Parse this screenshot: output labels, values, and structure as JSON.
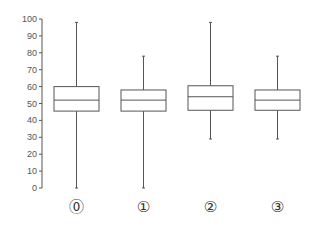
{
  "chart_data": {
    "type": "box",
    "title": "",
    "xlabel": "",
    "ylabel": "",
    "ylim": [
      0,
      100
    ],
    "yticks": [
      0,
      10,
      20,
      30,
      40,
      50,
      60,
      70,
      80,
      90,
      100
    ],
    "grid": false,
    "legend": null,
    "categories": [
      "⓪",
      "①",
      "②",
      "③"
    ],
    "boxes": [
      {
        "label": "⓪",
        "whisker_low": 0,
        "q1": 45.5,
        "median": 52,
        "q3": 60,
        "whisker_high": 98
      },
      {
        "label": "①",
        "whisker_low": 0,
        "q1": 45.5,
        "median": 52,
        "q3": 58,
        "whisker_high": 78
      },
      {
        "label": "②",
        "whisker_low": 29,
        "q1": 46,
        "median": 54,
        "q3": 60.5,
        "whisker_high": 98
      },
      {
        "label": "③",
        "whisker_low": 29,
        "q1": 46,
        "median": 52,
        "q3": 58,
        "whisker_high": 78
      }
    ],
    "colors": {
      "box_stroke": "#555555",
      "axis": "#555555",
      "tick_text": "#555555"
    }
  }
}
